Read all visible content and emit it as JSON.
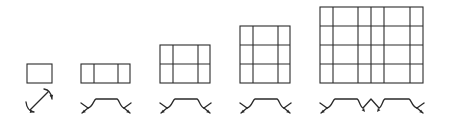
{
  "diagram": {
    "stroke_color": "#2a2a2a",
    "background": "#ffffff",
    "figures": [
      {
        "id": "grid-1x1",
        "grid": {
          "x": 27,
          "y": 64,
          "w": 25,
          "h": 19,
          "cols_x": [],
          "rows_y": []
        },
        "symbol": {
          "type": "diagonal-double-arrow",
          "x1": 30,
          "y1": 110,
          "x2": 48,
          "y2": 92
        }
      },
      {
        "id": "grid-3x1",
        "grid": {
          "x": 81,
          "y": 64,
          "w": 49,
          "h": 19,
          "cols_x": [
            94,
            118
          ],
          "rows_y": []
        },
        "symbol": {
          "type": "fold-profile",
          "x_left": 82,
          "x_right": 130,
          "top_y": 99,
          "inner_left": 95,
          "inner_right": 118,
          "base_y": 108,
          "segments": 1
        }
      },
      {
        "id": "grid-3x2",
        "grid": {
          "x": 160,
          "y": 45,
          "w": 50,
          "h": 38,
          "cols_x": [
            173,
            198
          ],
          "rows_y": [
            64
          ]
        },
        "symbol": {
          "type": "fold-profile",
          "x_left": 161,
          "x_right": 210,
          "top_y": 99,
          "inner_left": 174,
          "inner_right": 198,
          "base_y": 108,
          "segments": 1
        }
      },
      {
        "id": "grid-3x3",
        "grid": {
          "x": 240,
          "y": 26,
          "w": 50,
          "h": 57,
          "cols_x": [
            253,
            278
          ],
          "rows_y": [
            45,
            64
          ]
        },
        "symbol": {
          "type": "fold-profile",
          "x_left": 241,
          "x_right": 290,
          "top_y": 99,
          "inner_left": 254,
          "inner_right": 278,
          "base_y": 108,
          "segments": 1
        }
      },
      {
        "id": "grid-6x4",
        "grid": {
          "x": 320,
          "y": 7,
          "w": 103,
          "h": 76,
          "cols_x": [
            333,
            358,
            371,
            384,
            410
          ],
          "rows_y": [
            26,
            45,
            64
          ]
        },
        "symbol": {
          "type": "fold-profile-double",
          "x_left": 321,
          "x_right": 423,
          "top_y": 99,
          "base_y": 108,
          "inner": [
            [
              334,
              358
            ],
            [
              384,
              410
            ]
          ],
          "mid_peak_x": 371,
          "mid_peak_y": 99
        }
      }
    ]
  }
}
